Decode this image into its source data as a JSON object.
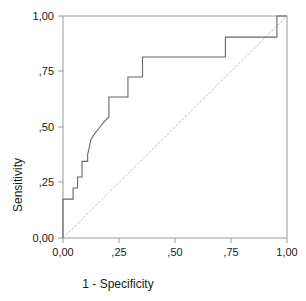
{
  "chart_data": {
    "type": "line",
    "title": "",
    "subtitle": "",
    "xlabel": "1 - Specificity",
    "ylabel": "Sensitivity",
    "xlim": [
      0,
      1
    ],
    "ylim": [
      0,
      1
    ],
    "grid": false,
    "legend": "none",
    "x_tick_labels": [
      "0,00",
      ",25",
      ",50",
      ",75",
      "1,00"
    ],
    "x_tick_values": [
      0,
      0.25,
      0.5,
      0.75,
      1.0
    ],
    "y_tick_labels": [
      "0,00",
      ",25",
      ",50",
      ",75",
      "1,00"
    ],
    "y_tick_values": [
      0,
      0.25,
      0.5,
      0.75,
      1.0
    ],
    "series": [
      {
        "name": "ROC Curve",
        "color": "#666666",
        "style": "solid",
        "x": [
          0.0,
          0.0,
          0.045,
          0.045,
          0.065,
          0.065,
          0.085,
          0.085,
          0.11,
          0.11,
          0.125,
          0.145,
          0.165,
          0.185,
          0.205,
          0.205,
          0.205,
          0.29,
          0.29,
          0.355,
          0.355,
          0.725,
          0.725,
          0.955,
          0.955,
          1.0
        ],
        "y": [
          0.0,
          0.175,
          0.175,
          0.225,
          0.225,
          0.275,
          0.275,
          0.345,
          0.345,
          0.375,
          0.445,
          0.475,
          0.5,
          0.525,
          0.545,
          0.545,
          0.635,
          0.635,
          0.725,
          0.725,
          0.815,
          0.815,
          0.905,
          0.905,
          1.0,
          1.0
        ]
      },
      {
        "name": "Reference Line",
        "color": "#bbbbbb",
        "style": "dotted",
        "x": [
          0.0,
          1.0
        ],
        "y": [
          0.0,
          1.0
        ]
      }
    ]
  },
  "axes": {
    "x_title": "1 - Specificity",
    "y_title": "Sensitivity"
  },
  "colors": {
    "curve": "#666666",
    "reference": "#bbbbbb",
    "frame": "#999999",
    "text": "#1a1a1a",
    "background": "#ffffff"
  }
}
